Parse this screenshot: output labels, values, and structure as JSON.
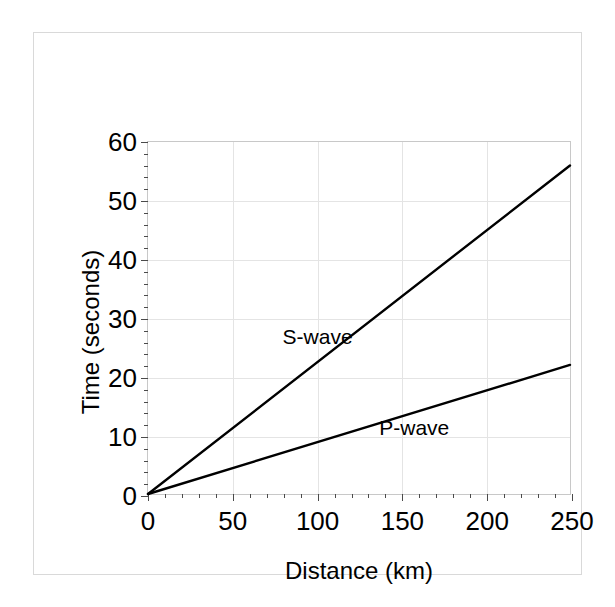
{
  "chart_data": {
    "type": "line",
    "title": "",
    "subtitle": "",
    "xlabel": "Distance (km)",
    "ylabel": "Time (seconds)",
    "xlim": [
      0,
      250
    ],
    "ylim": [
      0,
      60
    ],
    "x_ticks": [
      0,
      50,
      100,
      150,
      200,
      250
    ],
    "x_tick_labels": [
      "0",
      "50",
      "100",
      "150",
      "200",
      "250"
    ],
    "x_minor_tick_step": 10,
    "y_ticks": [
      0,
      10,
      20,
      30,
      40,
      50,
      60
    ],
    "y_tick_labels": [
      "0",
      "10",
      "20",
      "30",
      "40",
      "50",
      "60"
    ],
    "y_minor_tick_step": 2,
    "grid": true,
    "grid_color": "#e4e4e4",
    "legend_position": "inline-annotations",
    "line_color": "#000000",
    "line_width": 2.4,
    "x": [
      0,
      250
    ],
    "series": [
      {
        "name": "S-wave",
        "values": [
          0,
          56
        ],
        "slope_seconds_per_km": 0.224,
        "annotation": {
          "text": "S-wave",
          "x": 100,
          "y": 27
        }
      },
      {
        "name": "P-wave",
        "values": [
          0,
          22
        ],
        "slope_seconds_per_km": 0.088,
        "annotation": {
          "text": "P-wave",
          "x": 157,
          "y": 11.5
        }
      }
    ],
    "annotations": [
      "S-wave",
      "P-wave"
    ]
  }
}
